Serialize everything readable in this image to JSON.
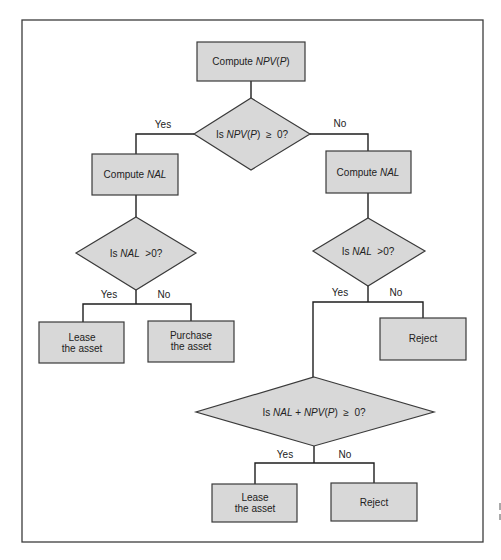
{
  "diagram": {
    "type": "flowchart",
    "colors": {
      "node_fill": "#d8d8d8",
      "node_stroke": "#3a3a3a",
      "connector": "#1e1e1e",
      "background": "#ffffff"
    },
    "nodes": {
      "start": {
        "kind": "process",
        "text_plain": "Compute ",
        "text_italic": "NPV",
        "text_paren_open": "(",
        "text_italic2": "P",
        "text_paren_close": ")"
      },
      "decision_npv": {
        "kind": "decision",
        "prefix": "Is ",
        "var": "NPV",
        "paren_open": "(",
        "var2": "P",
        "paren_close": ")",
        "suffix": "  ≥  0?"
      },
      "left_compute_nal": {
        "kind": "process",
        "text_plain": "Compute ",
        "text_italic": "NAL"
      },
      "right_compute_nal": {
        "kind": "process",
        "text_plain": "Compute ",
        "text_italic": "NAL"
      },
      "left_decision_nal": {
        "kind": "decision",
        "prefix": "Is ",
        "var": "NAL",
        "suffix": "  >0?"
      },
      "right_decision_nal": {
        "kind": "decision",
        "prefix": "Is ",
        "var": "NAL",
        "suffix": "  >0?"
      },
      "left_lease": {
        "kind": "terminal",
        "line1": "Lease",
        "line2": "the asset"
      },
      "left_purchase": {
        "kind": "terminal",
        "line1": "Purchase",
        "line2": "the asset"
      },
      "right_reject": {
        "kind": "terminal",
        "line1": "Reject"
      },
      "combined_decision": {
        "kind": "decision",
        "prefix": "Is ",
        "var": "NAL",
        "mid": " + ",
        "var2": "NPV",
        "paren_open": "(",
        "var3": "P",
        "paren_close": ")",
        "suffix": "  ≥  0?"
      },
      "bottom_lease": {
        "kind": "terminal",
        "line1": "Lease",
        "line2": "the asset"
      },
      "bottom_reject": {
        "kind": "terminal",
        "line1": "Reject"
      }
    },
    "edge_labels": {
      "npv_yes": "Yes",
      "npv_no": "No",
      "left_nal_yes": "Yes",
      "left_nal_no": "No",
      "right_nal_yes": "Yes",
      "right_nal_no": "No",
      "combined_yes": "Yes",
      "combined_no": "No"
    },
    "edges": [
      {
        "from": "start",
        "to": "decision_npv"
      },
      {
        "from": "decision_npv",
        "to": "left_compute_nal",
        "label": "Yes"
      },
      {
        "from": "decision_npv",
        "to": "right_compute_nal",
        "label": "No"
      },
      {
        "from": "left_compute_nal",
        "to": "left_decision_nal"
      },
      {
        "from": "left_decision_nal",
        "to": "left_lease",
        "label": "Yes"
      },
      {
        "from": "left_decision_nal",
        "to": "left_purchase",
        "label": "No"
      },
      {
        "from": "right_compute_nal",
        "to": "right_decision_nal"
      },
      {
        "from": "right_decision_nal",
        "to": "combined_decision",
        "label": "Yes"
      },
      {
        "from": "right_decision_nal",
        "to": "right_reject",
        "label": "No"
      },
      {
        "from": "combined_decision",
        "to": "bottom_lease",
        "label": "Yes"
      },
      {
        "from": "combined_decision",
        "to": "bottom_reject",
        "label": "No"
      }
    ]
  }
}
